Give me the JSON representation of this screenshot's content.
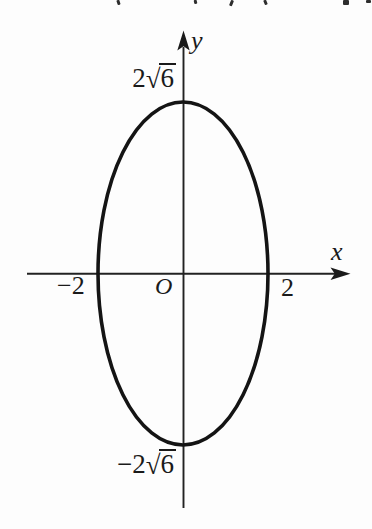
{
  "page": {
    "background": "#fdfdfd",
    "ink_color": "#1a1a1a"
  },
  "figure": {
    "type": "ellipse-graph",
    "axis_labels": {
      "x": "x",
      "y": "y"
    },
    "origin_label": "O",
    "x_intercept_labels": {
      "negative": "−2",
      "positive": "2"
    },
    "y_intercept_labels": {
      "positive": {
        "text": "2√6",
        "coefficient": "2",
        "radical_sign": "√",
        "radicand": "6"
      },
      "negative": {
        "text": "−2√6",
        "coefficient": "−2",
        "radical_sign": "√",
        "radicand": "6"
      }
    }
  },
  "top_cropped_marks": [
    {
      "x": 117,
      "y": 0,
      "w": 2.5,
      "h": 5,
      "r": -18
    },
    {
      "x": 194,
      "y": 0,
      "w": 2.5,
      "h": 4,
      "r": -12
    },
    {
      "x": 230,
      "y": 0,
      "w": 2.5,
      "h": 6,
      "r": 22
    },
    {
      "x": 264,
      "y": 0,
      "w": 2.5,
      "h": 5,
      "r": -22
    },
    {
      "x": 343,
      "y": 0,
      "w": 6,
      "h": 4.5,
      "r": 0
    },
    {
      "x": 366,
      "y": 0,
      "w": 4.5,
      "h": 2.5,
      "r": 0
    }
  ]
}
